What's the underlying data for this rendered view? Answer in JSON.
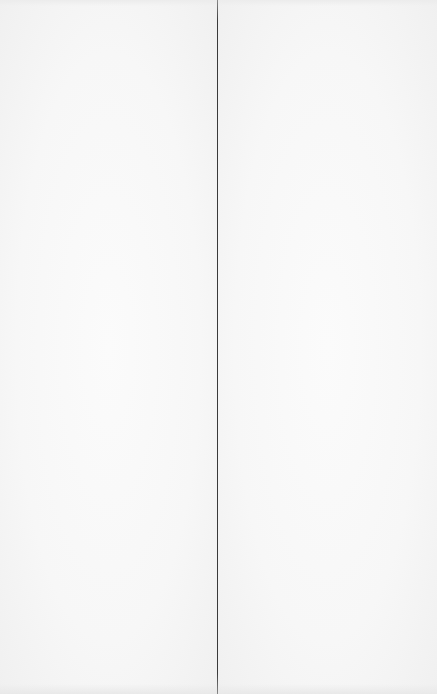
{
  "document": {
    "type": "book-spread",
    "left_page": {
      "content": ""
    },
    "right_page": {
      "content": ""
    }
  },
  "colors": {
    "paper": "#f7f7f7",
    "gutter_line": "#3a3a3a"
  }
}
